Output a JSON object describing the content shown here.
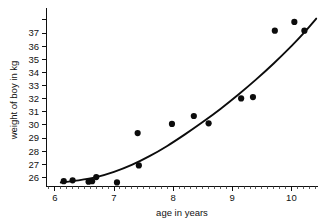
{
  "chart_data": {
    "type": "scatter",
    "title": "",
    "xlabel": "age in years",
    "ylabel": "weight of boy in kg",
    "xlim": [
      5.85,
      10.45
    ],
    "ylim": [
      25.35,
      38.45
    ],
    "grid": false,
    "legend": null,
    "x_ticks_major": [
      6,
      7,
      8,
      9,
      10
    ],
    "x_tick_labels": [
      "6",
      "7",
      "8",
      "9",
      "10"
    ],
    "x_minor_tick_step": 0.1,
    "y_ticks_major": [
      26,
      27,
      28,
      29,
      30,
      31,
      32,
      33,
      34,
      35,
      36,
      37,
      38
    ],
    "y_tick_labels": [
      "26",
      "27",
      "28",
      "29",
      "30",
      "31",
      "32",
      "33",
      "34",
      "35",
      "36",
      "37",
      ""
    ],
    "points": [
      {
        "x": 6.15,
        "y": 25.72
      },
      {
        "x": 6.3,
        "y": 25.78
      },
      {
        "x": 6.57,
        "y": 25.68
      },
      {
        "x": 6.63,
        "y": 25.72
      },
      {
        "x": 6.7,
        "y": 26.03
      },
      {
        "x": 7.05,
        "y": 25.62
      },
      {
        "x": 7.4,
        "y": 29.38
      },
      {
        "x": 7.42,
        "y": 26.92
      },
      {
        "x": 7.98,
        "y": 30.08
      },
      {
        "x": 8.35,
        "y": 30.68
      },
      {
        "x": 8.6,
        "y": 30.12
      },
      {
        "x": 9.15,
        "y": 32.02
      },
      {
        "x": 9.35,
        "y": 32.12
      },
      {
        "x": 9.72,
        "y": 37.18
      },
      {
        "x": 10.05,
        "y": 37.85
      },
      {
        "x": 10.22,
        "y": 37.18
      }
    ],
    "fit_curve": {
      "label": "fitted curve",
      "x_start": 6.1,
      "x_end": 10.42,
      "points": [
        {
          "x": 6.1,
          "y": 25.62
        },
        {
          "x": 6.4,
          "y": 25.78
        },
        {
          "x": 6.7,
          "y": 26.02
        },
        {
          "x": 7.0,
          "y": 26.42
        },
        {
          "x": 7.3,
          "y": 26.95
        },
        {
          "x": 7.6,
          "y": 27.62
        },
        {
          "x": 7.9,
          "y": 28.4
        },
        {
          "x": 8.2,
          "y": 29.28
        },
        {
          "x": 8.5,
          "y": 30.22
        },
        {
          "x": 8.8,
          "y": 31.22
        },
        {
          "x": 9.1,
          "y": 32.3
        },
        {
          "x": 9.4,
          "y": 33.45
        },
        {
          "x": 9.7,
          "y": 34.68
        },
        {
          "x": 10.0,
          "y": 36.0
        },
        {
          "x": 10.2,
          "y": 36.95
        },
        {
          "x": 10.42,
          "y": 38.1
        }
      ]
    }
  },
  "style": {
    "point_color": "#0c0c0c",
    "curve_color": "#0c0c0c",
    "axis_color": "#111111",
    "background": "#ffffff",
    "point_radius": 3.1
  }
}
